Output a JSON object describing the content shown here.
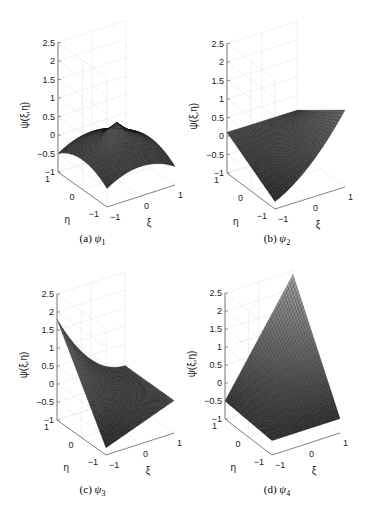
{
  "figure": {
    "panels": [
      {
        "id": "a",
        "caption": "(a) ψ1",
        "caption_prefix": "(a)",
        "caption_sym": "ψ",
        "caption_sub": "1"
      },
      {
        "id": "b",
        "caption": "(b) ψ2",
        "caption_prefix": "(b)",
        "caption_sym": "ψ",
        "caption_sub": "2"
      },
      {
        "id": "c",
        "caption": "(c) ψ3",
        "caption_prefix": "(c)",
        "caption_sym": "ψ",
        "caption_sub": "3"
      },
      {
        "id": "d",
        "caption": "(d) ψ4",
        "caption_prefix": "(d)",
        "caption_sym": "ψ",
        "caption_sub": "4"
      }
    ]
  },
  "chart_data": [
    {
      "type": "surface3d",
      "title": "(a) ψ1",
      "xlabel": "ξ",
      "ylabel": "η",
      "zlabel": "ψ(ξ,η)",
      "xlim": [
        -1,
        1
      ],
      "ylim": [
        -1,
        1
      ],
      "zlim": [
        -1,
        2.5
      ],
      "xticks": [
        -1,
        0,
        1
      ],
      "yticks": [
        -1,
        0,
        1
      ],
      "zticks": [
        -1,
        -0.5,
        0,
        0.5,
        1,
        1.5,
        2,
        2.5
      ],
      "corner_values": {
        "(-1,-1)": 0.9,
        "(1,-1)": -0.5,
        "(-1,1)": -0.5,
        "(1,1)": 0.9
      },
      "description": "saddle-like surface, peaks ~0.9 at two corners, -0.5 at others",
      "grid": true
    },
    {
      "type": "surface3d",
      "title": "(b) ψ2",
      "xlabel": "ξ",
      "ylabel": "η",
      "zlabel": "ψ(ξ,η)",
      "xlim": [
        -1,
        1
      ],
      "ylim": [
        -1,
        1
      ],
      "zlim": [
        -1,
        2.5
      ],
      "xticks": [
        -1,
        0,
        1
      ],
      "yticks": [
        -1,
        0,
        1
      ],
      "zticks": [
        -1,
        -0.5,
        0,
        0.5,
        1,
        1.5,
        2,
        2.5
      ],
      "corner_values": {
        "(-1,-1)": -0.8,
        "(1,-1)": 1.5,
        "(-1,1)": 0.1,
        "(1,1)": 0.1
      },
      "grid": true
    },
    {
      "type": "surface3d",
      "title": "(c) ψ3",
      "xlabel": "ξ",
      "ylabel": "η",
      "zlabel": "ψ(ξ,η)",
      "xlim": [
        -1,
        1
      ],
      "ylim": [
        -1,
        1
      ],
      "zlim": [
        -1,
        2.5
      ],
      "xticks": [
        -1,
        0,
        1
      ],
      "yticks": [
        -1,
        0,
        1
      ],
      "zticks": [
        -1,
        -0.5,
        0,
        0.5,
        1,
        1.5,
        2,
        2.5
      ],
      "corner_values": {
        "(-1,-1)": -0.8,
        "(1,-1)": -0.1,
        "(-1,1)": 1.8,
        "(1,1)": -0.1
      },
      "grid": true
    },
    {
      "type": "surface3d",
      "title": "(d) ψ4",
      "xlabel": "ξ",
      "ylabel": "η",
      "zlabel": "ψ(ξ,η)",
      "xlim": [
        -1,
        1
      ],
      "ylim": [
        -1,
        1
      ],
      "zlim": [
        -1,
        2.5
      ],
      "xticks": [
        -1,
        0,
        1
      ],
      "yticks": [
        -1,
        0,
        1
      ],
      "zticks": [
        -1,
        -0.5,
        0,
        0.5,
        1,
        1.5,
        2,
        2.5
      ],
      "corner_values": {
        "(-1,-1)": -0.6,
        "(1,-1)": -0.6,
        "(-1,1)": -0.5,
        "(1,1)": 2.4
      },
      "grid": true
    }
  ]
}
